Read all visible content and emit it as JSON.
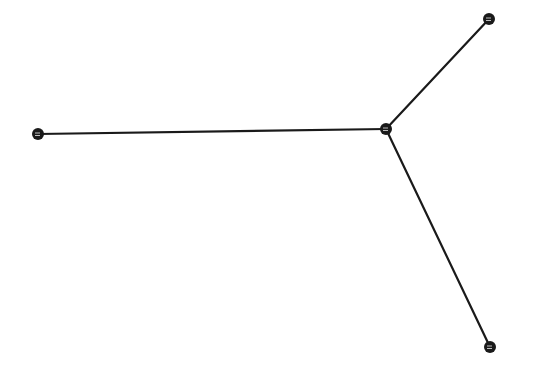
{
  "diagram": {
    "type": "star-graph",
    "background": "#ffffff",
    "stroke_color": "#1a1a1a",
    "node_radius": 6,
    "edge_width": 2.2,
    "nodes": [
      {
        "id": "center",
        "x": 386,
        "y": 129
      },
      {
        "id": "left",
        "x": 38,
        "y": 134
      },
      {
        "id": "top-right",
        "x": 489,
        "y": 19
      },
      {
        "id": "bottom-right",
        "x": 490,
        "y": 347
      }
    ],
    "edges": [
      {
        "from": "center",
        "to": "left"
      },
      {
        "from": "center",
        "to": "top-right"
      },
      {
        "from": "center",
        "to": "bottom-right"
      }
    ]
  }
}
